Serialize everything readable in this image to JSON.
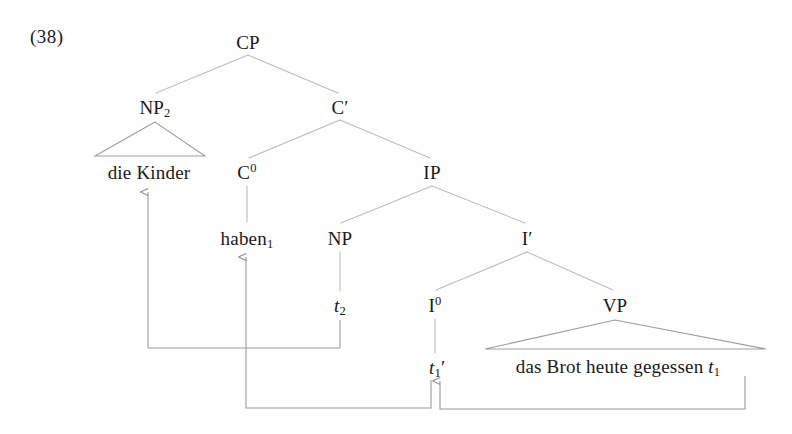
{
  "page": {
    "example_number": "(38)",
    "background_color": "#fefefe",
    "ink_color": "#1a1a1a",
    "line_color": "#b9b9b9",
    "arrow_color": "#9a9a9a"
  },
  "tree": {
    "description": "German CP syntax tree with verb-second movement and topicalization",
    "nodes": [
      {
        "id": "CP",
        "label": "CP",
        "x": 248,
        "y": 42,
        "kind": "category"
      },
      {
        "id": "NP2",
        "label": "NP",
        "sub": "2",
        "x": 155,
        "y": 107,
        "kind": "category"
      },
      {
        "id": "Cbar",
        "label": "C",
        "prime": "′",
        "x": 340,
        "y": 107,
        "kind": "category"
      },
      {
        "id": "dieKinder",
        "label": "die Kinder",
        "x": 149,
        "y": 172,
        "kind": "terminal"
      },
      {
        "id": "C0",
        "label": "C",
        "sup": "0",
        "x": 247,
        "y": 172,
        "kind": "category"
      },
      {
        "id": "IP",
        "label": "IP",
        "x": 432,
        "y": 172,
        "kind": "category"
      },
      {
        "id": "haben1",
        "label": "haben",
        "sub": "1",
        "x": 247,
        "y": 238,
        "kind": "terminal"
      },
      {
        "id": "NP",
        "label": "NP",
        "x": 340,
        "y": 238,
        "kind": "category"
      },
      {
        "id": "Ibar",
        "label": "I",
        "prime": "′",
        "x": 527,
        "y": 238,
        "kind": "category"
      },
      {
        "id": "t2",
        "label": "t",
        "sub": "2",
        "italic": true,
        "x": 340,
        "y": 305,
        "kind": "trace"
      },
      {
        "id": "I0",
        "label": "I",
        "sup": "0",
        "x": 435,
        "y": 305,
        "kind": "category"
      },
      {
        "id": "VP",
        "label": "VP",
        "x": 615,
        "y": 305,
        "kind": "category"
      },
      {
        "id": "t1prime",
        "label": "t",
        "sub": "1",
        "prime": "′",
        "italic": true,
        "x": 437,
        "y": 367,
        "kind": "trace"
      },
      {
        "id": "vpstring",
        "label": "das Brot heute gegessen ",
        "trace": "t",
        "trace_sub": "1",
        "x": 618,
        "y": 366,
        "kind": "terminal"
      }
    ],
    "branches": [
      {
        "from": "CP",
        "to": "NP2"
      },
      {
        "from": "CP",
        "to": "Cbar"
      },
      {
        "from": "Cbar",
        "to": "C0"
      },
      {
        "from": "Cbar",
        "to": "IP"
      },
      {
        "from": "C0",
        "to": "haben1"
      },
      {
        "from": "IP",
        "to": "NP"
      },
      {
        "from": "IP",
        "to": "Ibar"
      },
      {
        "from": "NP",
        "to": "t2"
      },
      {
        "from": "Ibar",
        "to": "I0"
      },
      {
        "from": "Ibar",
        "to": "VP"
      },
      {
        "from": "I0",
        "to": "t1prime"
      }
    ],
    "triangles": [
      {
        "apex": "NP2",
        "left_x": 95,
        "right_x": 205,
        "base_y": 156
      },
      {
        "apex": "VP",
        "left_x": 485,
        "right_x": 766,
        "base_y": 349
      }
    ],
    "movements": [
      {
        "id": "np-topicalization",
        "from": "t2",
        "to": "dieKinder",
        "label_from": "t2",
        "label_to": "die Kinder"
      },
      {
        "id": "i-to-c-raising",
        "from": "t1prime",
        "to": "haben1",
        "label_from": "t1'",
        "label_to": "haben1"
      },
      {
        "id": "v-to-i-raising",
        "from": "t1",
        "to": "t1prime",
        "label_from": "t1",
        "label_to": "t1'"
      }
    ]
  }
}
